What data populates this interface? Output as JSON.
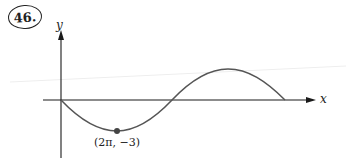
{
  "problem": {
    "number": "46."
  },
  "axes": {
    "x_label": "x",
    "y_label": "y"
  },
  "annotations": {
    "point_label": "(2π, −3)"
  },
  "colors": {
    "axes": "#1a1a1a",
    "curve": "#555555",
    "point": "#444444",
    "background": "#ffffff"
  },
  "curve": {
    "description": "y = -3 sin(x/4) over one period",
    "min_point": [
      6.283,
      -3
    ],
    "amplitude": 3
  }
}
